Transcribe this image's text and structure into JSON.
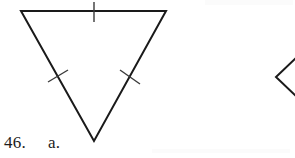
{
  "page": {
    "background_color": "#ffffff",
    "width": 295,
    "height": 158
  },
  "labels": {
    "problem_number": "46.",
    "part_letter": "a."
  },
  "figure": {
    "name": "inverted-triangle-with-congruence-ticks",
    "stroke_color": "#1a1a1a",
    "tick_color": "#3a3a3a",
    "fill_color": "none",
    "stroke_width": 2,
    "tick_stroke_width": 1.4,
    "vertices": {
      "top_left": {
        "x": 21,
        "y": 11
      },
      "top_right": {
        "x": 166,
        "y": 11
      },
      "bottom": {
        "x": 94,
        "y": 141
      }
    },
    "ticks": [
      {
        "side": "top",
        "x1": 94,
        "y1": 2,
        "x2": 94,
        "y2": 22
      },
      {
        "side": "left",
        "x1": 48,
        "y1": 82,
        "x2": 68,
        "y2": 70
      },
      {
        "side": "right",
        "x1": 120,
        "y1": 70,
        "x2": 140,
        "y2": 84
      }
    ]
  },
  "angle_mark": {
    "name": "partial-angle-symbol",
    "description": "Partially visible angle (less-than) symbol clipped at right edge of page",
    "stroke_color": "#1a1a1a",
    "stroke_width": 2,
    "vertex": {
      "x": 276,
      "y": 77
    },
    "upper_arm_end": {
      "x": 297,
      "y": 57
    },
    "lower_arm_end": {
      "x": 297,
      "y": 97
    }
  },
  "artifacts": {
    "top_right_smudge_color": "#fbfbfb",
    "bottom_band_color": "#fbfbfb"
  }
}
